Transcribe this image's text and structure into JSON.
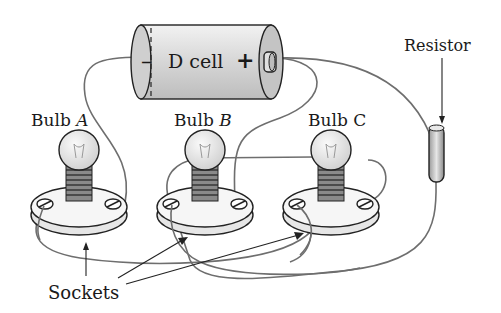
{
  "figure": {
    "battery": {
      "label": "D cell",
      "negative_sign": "–",
      "positive_sign": "+"
    },
    "resistor": {
      "label": "Resistor"
    },
    "bulbs": [
      {
        "prefix": "Bulb",
        "letter": "A"
      },
      {
        "prefix": "Bulb",
        "letter": "B"
      },
      {
        "prefix": "Bulb",
        "letter": "C"
      }
    ],
    "sockets_label": "Sockets",
    "colors": {
      "outline": "#222222",
      "wire": "#6e6e6e",
      "battery_fill": "#d9d9d9",
      "bulb_glass": "#ececec",
      "socket_fill": "#f4f4f4",
      "background": "#ffffff"
    }
  }
}
